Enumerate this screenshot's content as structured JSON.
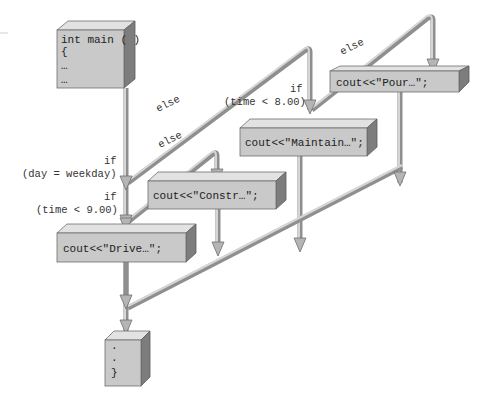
{
  "diagram": {
    "type": "flowchart",
    "title": "",
    "blocks": {
      "main": {
        "lines": [
          "int main ( )",
          "{",
          "…",
          "…"
        ]
      },
      "pour": {
        "text": "cout<<\"Pour…\";"
      },
      "maintain": {
        "text": "cout<<\"Maintain…\";"
      },
      "constr": {
        "text": "cout<<\"Constr…\";"
      },
      "drive": {
        "text": "cout<<\"Drive…\";"
      },
      "end": {
        "lines": [
          ".",
          ".",
          "}"
        ]
      }
    },
    "conditions": {
      "day": {
        "if": "if",
        "expr": "(day = weekday)"
      },
      "time9": {
        "if": "if",
        "expr": "(time < 9.00)"
      },
      "time8": {
        "if": "if",
        "expr": "(time < 8.00)"
      }
    },
    "branch_labels": {
      "else1": "else",
      "else2": "else",
      "else3": "else"
    }
  }
}
